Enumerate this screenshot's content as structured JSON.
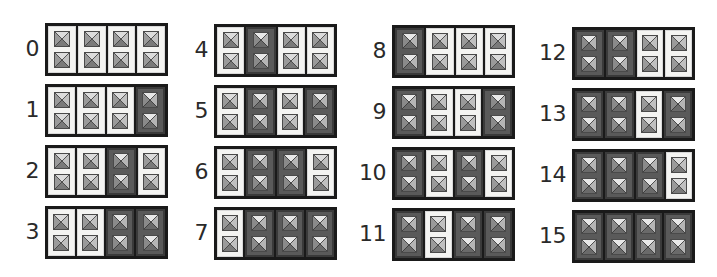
{
  "colors": {
    "off_bg": "#f4f4f2",
    "on_bg": "#5a5a5a",
    "frame": "#1a1a1a"
  },
  "groups": [
    {
      "label": "0",
      "bits": [
        0,
        0,
        0,
        0
      ]
    },
    {
      "label": "1",
      "bits": [
        0,
        0,
        0,
        1
      ]
    },
    {
      "label": "2",
      "bits": [
        0,
        0,
        1,
        0
      ]
    },
    {
      "label": "3",
      "bits": [
        0,
        0,
        1,
        1
      ]
    },
    {
      "label": "4",
      "bits": [
        0,
        1,
        0,
        0
      ]
    },
    {
      "label": "5",
      "bits": [
        0,
        1,
        0,
        1
      ]
    },
    {
      "label": "6",
      "bits": [
        0,
        1,
        1,
        0
      ]
    },
    {
      "label": "7",
      "bits": [
        0,
        1,
        1,
        1
      ]
    },
    {
      "label": "8",
      "bits": [
        1,
        0,
        0,
        0
      ]
    },
    {
      "label": "9",
      "bits": [
        1,
        0,
        0,
        1
      ]
    },
    {
      "label": "10",
      "bits": [
        1,
        0,
        1,
        0
      ]
    },
    {
      "label": "11",
      "bits": [
        1,
        0,
        1,
        1
      ]
    },
    {
      "label": "12",
      "bits": [
        1,
        1,
        0,
        0
      ]
    },
    {
      "label": "13",
      "bits": [
        1,
        1,
        0,
        1
      ]
    },
    {
      "label": "14",
      "bits": [
        1,
        1,
        1,
        0
      ]
    },
    {
      "label": "15",
      "bits": [
        1,
        1,
        1,
        1
      ]
    }
  ],
  "icon": "pyramid-stud-icon"
}
